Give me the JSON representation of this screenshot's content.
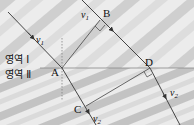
{
  "diagram": {
    "type": "wave-refraction",
    "regions": [
      {
        "id": "region-1",
        "label": "영역 Ⅰ"
      },
      {
        "id": "region-2",
        "label": "영역 Ⅱ"
      }
    ],
    "points": {
      "A": "A",
      "B": "B",
      "C": "C",
      "D": "D"
    },
    "velocities": {
      "v1": "v",
      "v1_sub": "1",
      "v2": "v",
      "v2_sub": "2"
    },
    "colors": {
      "line": "#444444",
      "boundary": "#888888",
      "background_light": "#f4f4f4",
      "background_dark": "#a8a8a8"
    }
  }
}
